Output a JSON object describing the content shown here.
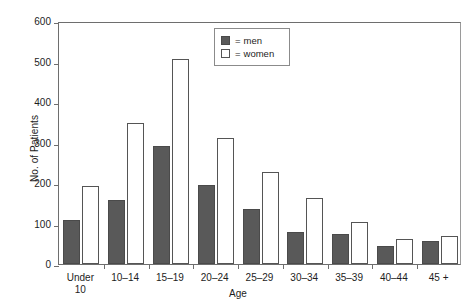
{
  "chart_data": {
    "type": "bar",
    "title": "",
    "xlabel": "Age",
    "ylabel": "No. of Patients",
    "categories": [
      "Under\n10",
      "10–14",
      "15–19",
      "20–24",
      "25–29",
      "30–34",
      "35–39",
      "40–44",
      "45 +"
    ],
    "series": [
      {
        "name": "men",
        "values": [
          108,
          157,
          291,
          195,
          136,
          80,
          74,
          44,
          58
        ],
        "color": "#595959"
      },
      {
        "name": "women",
        "values": [
          192,
          348,
          506,
          312,
          228,
          163,
          104,
          63,
          68
        ],
        "color": "#ffffff"
      }
    ],
    "ylim": [
      0,
      600
    ],
    "yticks": [
      0,
      100,
      200,
      300,
      400,
      500,
      600
    ],
    "ytick_labels": [
      "0",
      "100",
      "200",
      "300",
      "400",
      "500",
      "600"
    ],
    "grid": false,
    "legend": {
      "position": "top-center",
      "entries": [
        {
          "equals": "=",
          "label": "men",
          "swatch": "men"
        },
        {
          "equals": "=",
          "label": "women",
          "swatch": "women"
        }
      ]
    }
  }
}
